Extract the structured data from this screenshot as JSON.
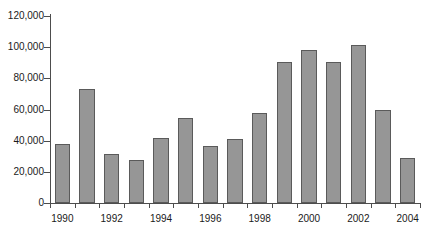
{
  "chart_data": {
    "type": "bar",
    "title": "",
    "subtitle": "",
    "xlabel": "",
    "ylabel": "",
    "categories": [
      "1990",
      "1991",
      "1992",
      "1993",
      "1994",
      "1995",
      "1996",
      "1997",
      "1998",
      "1999",
      "2000",
      "2001",
      "2002",
      "2003",
      "2004"
    ],
    "values": [
      38000,
      73000,
      31500,
      27500,
      41500,
      54500,
      36500,
      41000,
      57500,
      90500,
      98000,
      90500,
      101500,
      60000,
      29000
    ],
    "ylim": [
      0,
      120000
    ],
    "ytick_values": [
      0,
      20000,
      40000,
      60000,
      80000,
      100000,
      120000
    ],
    "ytick_labels": [
      "0",
      "20,000",
      "40,000",
      "60,000",
      "80,000",
      "100,000",
      "120,000"
    ],
    "xtick_labels": [
      "1990",
      "1992",
      "1994",
      "1996",
      "1998",
      "2000",
      "2002",
      "2004"
    ],
    "xtick_label_indices": [
      0,
      2,
      4,
      6,
      8,
      10,
      12,
      14
    ],
    "grid": false,
    "legend": "none",
    "bar_color": "#969696",
    "bar_border_color": "#5a5a5a",
    "axis_color": "#4d4d4d",
    "text_color": "#1a1a1a",
    "background": "#ffffff"
  }
}
